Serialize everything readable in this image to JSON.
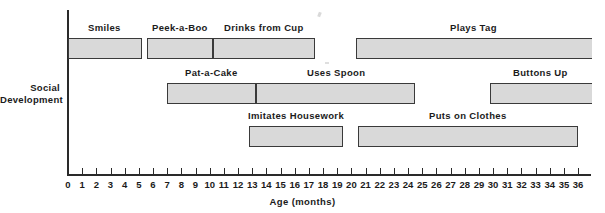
{
  "chart_data": {
    "type": "bar",
    "title": "",
    "xlabel": "Age  (months)",
    "ylabel": "Social Development",
    "ylabel_lines": [
      "Social",
      "Development"
    ],
    "xlim": [
      0,
      37
    ],
    "xtick_step": 1,
    "grid": false,
    "legend": "none",
    "units": "months",
    "xticks": [
      "0",
      "1",
      "2",
      "3",
      "4",
      "5",
      "6",
      "7",
      "8",
      "9",
      "10",
      "11",
      "12",
      "13",
      "14",
      "15",
      "16",
      "17",
      "18",
      "19",
      "20",
      "21",
      "22",
      "23",
      "24",
      "25",
      "26",
      "27",
      "28",
      "29",
      "30",
      "31",
      "32",
      "33",
      "34",
      "35",
      "36"
    ],
    "rows": [
      {
        "row": 1,
        "bars": [
          {
            "label": "Smiles",
            "start": 0.0,
            "end": 5.2,
            "open_right": false
          },
          {
            "label": "Peek-a-Boo",
            "start": 5.6,
            "end": 10.2,
            "open_right": false
          },
          {
            "label": "Drinks from Cup",
            "start": 10.2,
            "end": 17.4,
            "open_right": false
          },
          {
            "label": "Plays Tag",
            "start": 20.3,
            "end": 37.0,
            "open_right": true
          }
        ]
      },
      {
        "row": 2,
        "bars": [
          {
            "label": "Pat-a-Cake",
            "start": 7.0,
            "end": 13.3,
            "open_right": false
          },
          {
            "label": "Uses Spoon",
            "start": 13.3,
            "end": 24.5,
            "open_right": false
          },
          {
            "label": "Buttons Up",
            "start": 29.8,
            "end": 37.0,
            "open_right": true
          }
        ]
      },
      {
        "row": 3,
        "bars": [
          {
            "label": "Imitates Housework",
            "start": 12.8,
            "end": 19.4,
            "open_right": false
          },
          {
            "label": "Puts on Clothes",
            "start": 20.5,
            "end": 36.0,
            "open_right": false
          }
        ]
      }
    ]
  },
  "axis": {
    "x_title": "Age  (months)",
    "y_title_line1": "Social",
    "y_title_line2": "Development"
  }
}
